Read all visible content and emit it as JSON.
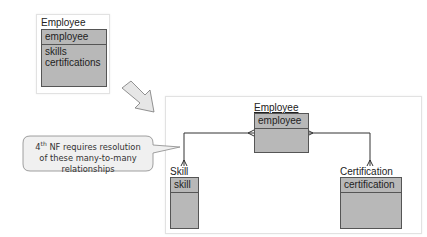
{
  "before": {
    "entity": {
      "name": "Employee",
      "key": "employee",
      "attributes": [
        "skills",
        "certifications"
      ]
    }
  },
  "after": {
    "entities": [
      {
        "name": "Employee",
        "key": "employee"
      },
      {
        "name": "Skill",
        "key": "skill"
      },
      {
        "name": "Certification",
        "key": "certification"
      }
    ]
  },
  "callout": {
    "number": "4",
    "superscript": "th",
    "line1_rest": " NF requires resolution",
    "line2": "of these many-to-many",
    "line3": "relationships"
  },
  "arrow": {
    "direction": "down-right",
    "icon": "transform-arrow-icon"
  }
}
